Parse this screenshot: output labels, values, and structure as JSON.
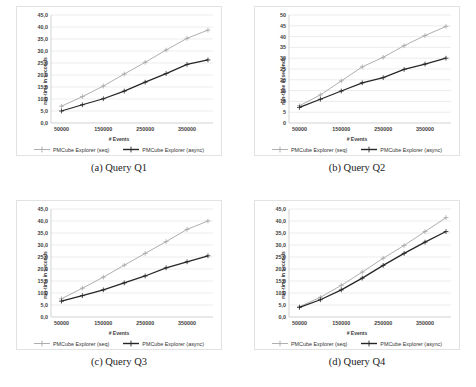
{
  "figure": {
    "series_names": {
      "seq": "PMCube Explorer (seq)",
      "async": "PMCube Explorer (async)"
    },
    "colors": {
      "seq": "#a6a6a6",
      "async": "#262626",
      "grid": "#d9d9d9",
      "axis": "#bfbfbf",
      "card_border": "#e2e2e2",
      "text": "#404040"
    },
    "captions": {
      "a": "(a) Query Q1",
      "b": "(b) Query Q2",
      "c": "(c) Query Q3",
      "d": "(d) Query Q4"
    }
  },
  "chart_data": [
    {
      "id": "q1",
      "type": "line",
      "title": "(a) Query Q1",
      "xlabel": "# Events",
      "ylabel": "run-time in seconds",
      "x": [
        50000,
        100000,
        150000,
        200000,
        250000,
        300000,
        350000,
        400000
      ],
      "xticks": [
        50000,
        150000,
        250000,
        350000
      ],
      "xticklabels": [
        "50000",
        "150000",
        "250000",
        "350000"
      ],
      "xlim": [
        25000,
        412000
      ],
      "yticks": [
        0,
        5,
        10,
        15,
        20,
        25,
        30,
        35,
        40,
        45
      ],
      "yticklabels": [
        "0,0",
        "5,0",
        "10,0",
        "15,0",
        "20,0",
        "25,0",
        "30,0",
        "35,0",
        "40,0",
        "45,0"
      ],
      "ylim": [
        0,
        45
      ],
      "grid": true,
      "legend_position": "bottom",
      "series": [
        {
          "name": "PMCube Explorer (seq)",
          "key": "seq",
          "values": [
            7.0,
            11.0,
            15.4,
            20.4,
            25.3,
            30.4,
            35.3,
            38.7
          ]
        },
        {
          "name": "PMCube Explorer (async)",
          "key": "async",
          "values": [
            5.0,
            7.6,
            10.1,
            13.3,
            17.0,
            20.6,
            24.4,
            26.3
          ]
        }
      ]
    },
    {
      "id": "q2",
      "type": "line",
      "title": "(b) Query Q2",
      "xlabel": "# Events",
      "ylabel": "run-time in seconds",
      "x": [
        50000,
        100000,
        150000,
        200000,
        250000,
        300000,
        350000,
        400000
      ],
      "xticks": [
        50000,
        150000,
        250000,
        350000
      ],
      "xticklabels": [
        "50000",
        "150000",
        "250000",
        "350000"
      ],
      "xlim": [
        25000,
        412000
      ],
      "yticks": [
        0,
        5,
        10,
        15,
        20,
        25,
        30,
        35,
        40,
        45,
        50
      ],
      "yticklabels": [
        "0",
        "5",
        "10",
        "15",
        "20",
        "25",
        "30",
        "35",
        "40",
        "45",
        "50"
      ],
      "ylim": [
        0,
        50
      ],
      "grid": true,
      "legend_position": "bottom",
      "series": [
        {
          "name": "PMCube Explorer (seq)",
          "key": "seq",
          "values": [
            8.0,
            13.0,
            19.5,
            26.0,
            30.4,
            35.8,
            40.5,
            44.7
          ]
        },
        {
          "name": "PMCube Explorer (async)",
          "key": "async",
          "values": [
            7.2,
            11.0,
            14.8,
            18.6,
            21.0,
            24.8,
            27.3,
            30.0
          ]
        }
      ]
    },
    {
      "id": "q3",
      "type": "line",
      "title": "(c) Query Q3",
      "xlabel": "# Events",
      "ylabel": "run-time in seconds",
      "x": [
        50000,
        100000,
        150000,
        200000,
        250000,
        300000,
        350000,
        400000
      ],
      "xticks": [
        50000,
        150000,
        250000,
        350000
      ],
      "xticklabels": [
        "50000",
        "150000",
        "250000",
        "350000"
      ],
      "xlim": [
        25000,
        412000
      ],
      "yticks": [
        0,
        5,
        10,
        15,
        20,
        25,
        30,
        35,
        40,
        45
      ],
      "yticklabels": [
        "0,0",
        "5,0",
        "10,0",
        "15,0",
        "20,0",
        "25,0",
        "30,0",
        "35,0",
        "40,0",
        "45,0"
      ],
      "ylim": [
        0,
        45
      ],
      "grid": true,
      "legend_position": "bottom",
      "series": [
        {
          "name": "PMCube Explorer (seq)",
          "key": "seq",
          "values": [
            7.6,
            12.0,
            16.6,
            21.6,
            26.5,
            31.4,
            36.5,
            40.0
          ]
        },
        {
          "name": "PMCube Explorer (async)",
          "key": "async",
          "values": [
            6.6,
            8.9,
            11.3,
            14.2,
            17.1,
            20.5,
            23.0,
            25.5
          ]
        }
      ]
    },
    {
      "id": "q4",
      "type": "line",
      "title": "(d) Query Q4",
      "xlabel": "# Events",
      "ylabel": "run-time in seconds",
      "x": [
        50000,
        100000,
        150000,
        200000,
        250000,
        300000,
        350000,
        400000
      ],
      "xticks": [
        50000,
        150000,
        250000,
        350000
      ],
      "xticklabels": [
        "50000",
        "150000",
        "250000",
        "350000"
      ],
      "xlim": [
        25000,
        412000
      ],
      "yticks": [
        0,
        5,
        10,
        15,
        20,
        25,
        30,
        35,
        40,
        45
      ],
      "yticklabels": [
        "0,0",
        "5,0",
        "10,0",
        "15,0",
        "20,0",
        "25,0",
        "30,0",
        "35,0",
        "40,0",
        "45,0"
      ],
      "ylim": [
        0,
        45
      ],
      "grid": true,
      "legend_position": "bottom",
      "series": [
        {
          "name": "PMCube Explorer (seq)",
          "key": "seq",
          "values": [
            4.3,
            8.2,
            13.2,
            18.7,
            24.5,
            29.8,
            35.6,
            41.4
          ]
        },
        {
          "name": "PMCube Explorer (async)",
          "key": "async",
          "values": [
            4.0,
            7.2,
            11.3,
            16.2,
            21.5,
            26.5,
            31.2,
            35.6
          ]
        }
      ]
    }
  ]
}
